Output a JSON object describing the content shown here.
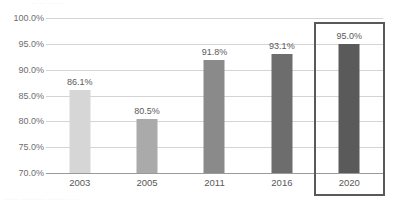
{
  "edges": {
    "top_sliver_text": "....  ....   ..........",
    "bottom_sliver_text": "........ ............. ......... ......."
  },
  "chart_data": {
    "type": "bar",
    "title": "",
    "subtitle": "",
    "xlabel": "",
    "ylabel": "",
    "categories": [
      "2003",
      "2005",
      "2011",
      "2016",
      "2020"
    ],
    "values": [
      86.1,
      80.5,
      91.8,
      93.1,
      95.0
    ],
    "data_labels": [
      "86.1%",
      "80.5%",
      "91.8%",
      "93.1%",
      "95.0%"
    ],
    "bar_colors": [
      "#d6d6d6",
      "#aaaaaa",
      "#8a8a8a",
      "#6d6d6d",
      "#5a5a5a"
    ],
    "ylim": [
      70.0,
      100.0
    ],
    "yticks": [
      70.0,
      75.0,
      80.0,
      85.0,
      90.0,
      95.0,
      100.0
    ],
    "ytick_labels": [
      "70.0%",
      "75.0%",
      "80.0%",
      "85.0%",
      "90.0%",
      "95.0%",
      "100.0%"
    ],
    "grid": true,
    "grid_color": "#d4d4d4",
    "axis_color": "#9a9a9a",
    "legend": null,
    "legend_position": "none",
    "highlight": {
      "category": "2020",
      "index": 4,
      "border_color": "#595959",
      "border_width_px": 2.5
    }
  }
}
